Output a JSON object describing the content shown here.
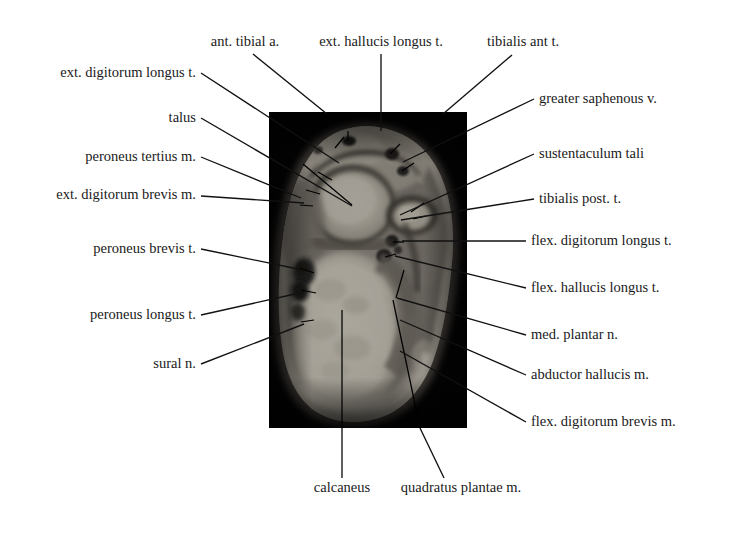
{
  "figure": {
    "canvas": {
      "width": 732,
      "height": 537
    },
    "background_color": "#ffffff",
    "text_color": "#1a1a1a",
    "leader_color": "#111111"
  },
  "image_panel": {
    "name": "mri-cross-section",
    "frame_color": "#040404",
    "x": 269,
    "y": 112,
    "width": 198,
    "height": 316
  },
  "labels_top": [
    {
      "id": "ant-tibial-a",
      "text": "ant. tibial a.",
      "x": 245,
      "y": 46,
      "anchor": "middle"
    },
    {
      "id": "ext-hallucis-longus-t",
      "text": "ext. hallucis longus t.",
      "x": 381,
      "y": 46,
      "anchor": "middle"
    },
    {
      "id": "tibialis-ant-t",
      "text": "tibialis ant t.",
      "x": 523,
      "y": 46,
      "anchor": "middle"
    }
  ],
  "labels_left": [
    {
      "id": "ext-digitorum-longus-t",
      "text": "ext. digitorum longus t.",
      "x": 196,
      "y": 77,
      "anchor": "end"
    },
    {
      "id": "talus",
      "text": "talus",
      "x": 196,
      "y": 122,
      "anchor": "end"
    },
    {
      "id": "peroneus-tertius-m",
      "text": "peroneus tertius m.",
      "x": 196,
      "y": 161,
      "anchor": "end"
    },
    {
      "id": "ext-digitorum-brevis-m",
      "text": "ext. digitorum brevis m.",
      "x": 196,
      "y": 199,
      "anchor": "end"
    },
    {
      "id": "peroneus-brevis-t",
      "text": "peroneus brevis t.",
      "x": 196,
      "y": 253,
      "anchor": "end"
    },
    {
      "id": "peroneus-longus-t",
      "text": "peroneus longus t.",
      "x": 196,
      "y": 319,
      "anchor": "end"
    },
    {
      "id": "sural-n",
      "text": "sural n.",
      "x": 196,
      "y": 368,
      "anchor": "end"
    }
  ],
  "labels_right": [
    {
      "id": "greater-saphenous-v",
      "text": "greater saphenous v.",
      "x": 539,
      "y": 103,
      "anchor": "start"
    },
    {
      "id": "sustentaculum-tali",
      "text": "sustentaculum tali",
      "x": 539,
      "y": 158,
      "anchor": "start"
    },
    {
      "id": "tibialis-post-t",
      "text": "tibialis post. t.",
      "x": 539,
      "y": 203,
      "anchor": "start"
    },
    {
      "id": "flex-digitorum-longus-t",
      "text": "flex. digitorum longus t.",
      "x": 531,
      "y": 245,
      "anchor": "start"
    },
    {
      "id": "flex-hallucis-longus-t",
      "text": "flex. hallucis longus t.",
      "x": 531,
      "y": 292,
      "anchor": "start"
    },
    {
      "id": "med-plantar-n",
      "text": "med. plantar n.",
      "x": 531,
      "y": 339,
      "anchor": "start"
    },
    {
      "id": "abductor-hallucis-m",
      "text": "abductor hallucis m.",
      "x": 531,
      "y": 379,
      "anchor": "start"
    },
    {
      "id": "flex-digitorum-brevis-m",
      "text": "flex. digitorum brevis m.",
      "x": 531,
      "y": 426,
      "anchor": "start"
    }
  ],
  "labels_bottom": [
    {
      "id": "calcaneus",
      "text": "calcaneus",
      "x": 342,
      "y": 492,
      "anchor": "middle"
    },
    {
      "id": "quadratus-plantae-m",
      "text": "quadratus plantae  m.",
      "x": 461,
      "y": 492,
      "anchor": "middle"
    }
  ],
  "leaders": [
    {
      "for": "ant-tibial-a",
      "points": "253,54 326,113"
    },
    {
      "for": "ext-hallucis-longus-t",
      "points": "381,54 381,128"
    },
    {
      "for": "tibialis-ant-t",
      "points": "513,54 443,114"
    },
    {
      "for": "ext-digitorum-longus-t",
      "points": "200,73 338,163"
    },
    {
      "for": "talus",
      "points": "200,118 377,232"
    },
    {
      "for": "peroneus-tertius-m",
      "points": "200,157 300,198"
    },
    {
      "for": "ext-digitorum-brevis-m",
      "points": "200,196 303,203"
    },
    {
      "for": "peroneus-brevis-t",
      "points": "200,249 302,270"
    },
    {
      "for": "peroneus-longus-t",
      "points": "200,315 303,292"
    },
    {
      "for": "sural-n",
      "points": "200,364 303,324"
    },
    {
      "for": "greater-saphenous-v",
      "points": "533,99 402,162"
    },
    {
      "for": "sustentaculum-tali",
      "points": "533,154 399,215"
    },
    {
      "for": "tibialis-post-t",
      "points": "533,199 400,220"
    },
    {
      "for": "flex-digitorum-longus-t",
      "points": "525,241 401,241"
    },
    {
      "for": "flex-hallucis-longus-t",
      "points": "525,288 394,256"
    },
    {
      "for": "med-plantar-n",
      "points": "525,335 396,298"
    },
    {
      "for": "abductor-hallucis-m",
      "points": "525,375 399,320"
    },
    {
      "for": "flex-digitorum-brevis-m",
      "points": "525,422 399,351"
    },
    {
      "for": "calcaneus",
      "points": "342,478 342,310"
    },
    {
      "for": "quadratus-plantae-m",
      "points": "443,478 393,300"
    }
  ],
  "inner_pointers": [
    {
      "id": "ptr-ant-tibial-a",
      "points": "348,131 348,140"
    },
    {
      "id": "ptr-ext-hall-1",
      "points": "342,138 338,148"
    },
    {
      "id": "ptr-tib-ant-1",
      "points": "398,145 391,153"
    },
    {
      "id": "ptr-tib-ant-2",
      "points": "412,163 402,170"
    },
    {
      "id": "ptr-ped-1",
      "points": "318,173 331,179"
    },
    {
      "id": "ptr-ped-2",
      "points": "308,188 320,192"
    },
    {
      "id": "ptr-ped-3",
      "points": "302,204 314,205"
    },
    {
      "id": "ptr-sap-1",
      "points": "422,204 410,212"
    },
    {
      "id": "ptr-sus-1",
      "points": "424,215 412,218"
    },
    {
      "id": "ptr-fdl-1",
      "points": "402,242 392,242"
    },
    {
      "id": "ptr-fhl-1",
      "points": "393,254 384,256"
    },
    {
      "id": "ptr-per-b",
      "points": "302,268 313,272"
    },
    {
      "id": "ptr-per-l",
      "points": "303,290 315,292"
    },
    {
      "id": "ptr-sural",
      "points": "303,322 313,320"
    }
  ],
  "mri": {
    "type": "grayscale-mri-axial",
    "background": "#030303",
    "soft_tissue_mid": "#8f8a82",
    "bone_marrow_bright": "#d8d2c6",
    "cortical_dark": "#2a2724",
    "fat_bright": "#efe9dc",
    "structures": [
      {
        "name": "talus",
        "tone": "bright"
      },
      {
        "name": "calcaneus",
        "tone": "bright"
      },
      {
        "name": "sustentaculum tali",
        "tone": "mid-bright"
      },
      {
        "name": "flexor tendons",
        "tone": "dark"
      },
      {
        "name": "neurovascular bundle",
        "tone": "dark"
      }
    ]
  }
}
